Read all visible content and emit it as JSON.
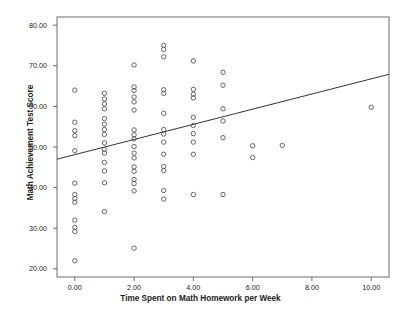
{
  "chart_data": {
    "type": "scatter",
    "title": "",
    "xlabel": "Time Spent on Math Homework per Week",
    "ylabel": "Math Achievement Test Score",
    "xlim": [
      -0.6,
      10.6
    ],
    "ylim": [
      18.0,
      82.0
    ],
    "xticks": [
      "0.00",
      "2.00",
      "4.00",
      "6.00",
      "8.00",
      "10.00"
    ],
    "xtick_values": [
      0,
      2,
      4,
      6,
      8,
      10
    ],
    "yticks": [
      "20.00",
      "30.00",
      "40.00",
      "50.00",
      "60.00",
      "70.00",
      "80.00"
    ],
    "ytick_values": [
      20,
      30,
      40,
      50,
      60,
      70,
      80
    ],
    "grid": false,
    "legend": false,
    "marker": "open-circle",
    "marker_color": "#555555",
    "line_color": "#333333",
    "points": [
      [
        0,
        64.0
      ],
      [
        0,
        56.1
      ],
      [
        0,
        54.0
      ],
      [
        0,
        52.8
      ],
      [
        0,
        49.1
      ],
      [
        0,
        41.1
      ],
      [
        0,
        38.3
      ],
      [
        0,
        37.3
      ],
      [
        0,
        36.4
      ],
      [
        0,
        32.0
      ],
      [
        0,
        30.2
      ],
      [
        0,
        29.2
      ],
      [
        0,
        22.0
      ],
      [
        1,
        63.2
      ],
      [
        1,
        61.8
      ],
      [
        1,
        60.6
      ],
      [
        1,
        59.4
      ],
      [
        1,
        57.0
      ],
      [
        1,
        55.6
      ],
      [
        1,
        54.3
      ],
      [
        1,
        53.1
      ],
      [
        1,
        51.0
      ],
      [
        1,
        49.4
      ],
      [
        1,
        48.5
      ],
      [
        1,
        46.2
      ],
      [
        1,
        44.1
      ],
      [
        1,
        41.2
      ],
      [
        1,
        34.1
      ],
      [
        2,
        70.2
      ],
      [
        2,
        64.8
      ],
      [
        2,
        63.9
      ],
      [
        2,
        62.3
      ],
      [
        2,
        61.1
      ],
      [
        2,
        59.1
      ],
      [
        2,
        54.2
      ],
      [
        2,
        53.0
      ],
      [
        2,
        52.0
      ],
      [
        2,
        50.1
      ],
      [
        2,
        48.5
      ],
      [
        2,
        47.3
      ],
      [
        2,
        45.1
      ],
      [
        2,
        44.0
      ],
      [
        2,
        42.0
      ],
      [
        2,
        41.0
      ],
      [
        2,
        39.2
      ],
      [
        2,
        25.1
      ],
      [
        3,
        75.0
      ],
      [
        3,
        74.0
      ],
      [
        3,
        72.2
      ],
      [
        3,
        64.1
      ],
      [
        3,
        63.2
      ],
      [
        3,
        58.3
      ],
      [
        3,
        54.3
      ],
      [
        3,
        53.2
      ],
      [
        3,
        51.2
      ],
      [
        3,
        48.2
      ],
      [
        3,
        45.2
      ],
      [
        3,
        44.2
      ],
      [
        3,
        39.3
      ],
      [
        3,
        37.2
      ],
      [
        4,
        71.2
      ],
      [
        4,
        64.2
      ],
      [
        4,
        63.0
      ],
      [
        4,
        62.1
      ],
      [
        4,
        57.3
      ],
      [
        4,
        55.3
      ],
      [
        4,
        53.3
      ],
      [
        4,
        51.2
      ],
      [
        4,
        48.2
      ],
      [
        4,
        38.3
      ],
      [
        5,
        68.4
      ],
      [
        5,
        65.2
      ],
      [
        5,
        59.4
      ],
      [
        5,
        56.4
      ],
      [
        5,
        52.3
      ],
      [
        5,
        38.3
      ],
      [
        6,
        50.3
      ],
      [
        6,
        47.4
      ],
      [
        7,
        50.4
      ],
      [
        10,
        59.8
      ]
    ],
    "regression_line": {
      "x_start": -0.6,
      "y_start": 47.0,
      "x_end": 10.6,
      "y_end": 67.9
    }
  }
}
